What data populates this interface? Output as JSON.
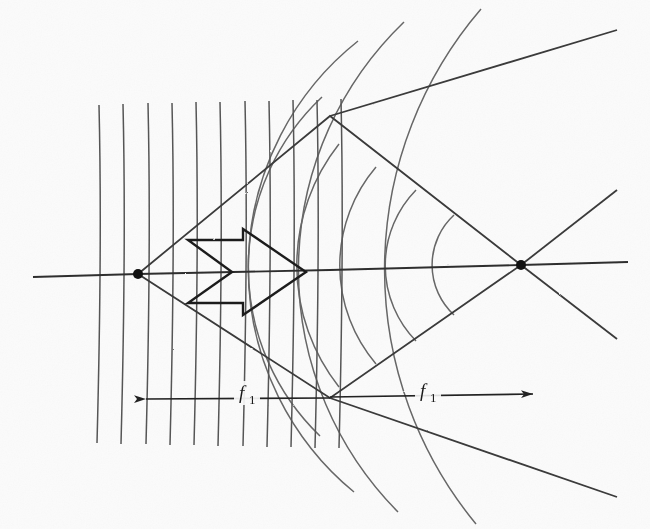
{
  "figure": {
    "kind": "optics-ray-diagram",
    "width": 650,
    "height": 529,
    "background_color": "#fbfbfb",
    "ink_color": "#3d3d3d",
    "bold_ink_color": "#151515"
  },
  "labels": {
    "left_focal": {
      "symbol": "f",
      "subscript": "1",
      "x": 243,
      "y": 398
    },
    "right_focal": {
      "symbol": "f",
      "subscript": "1",
      "x": 424,
      "y": 398
    }
  },
  "optical_axis": {
    "name": "optical-axis",
    "x_start": 33,
    "x_end": 628,
    "y_left": 276,
    "y_right": 264
  },
  "lens_plane": {
    "name": "lens-plane-dashed",
    "x": 330,
    "color": "#151515",
    "segments": [
      {
        "y1": 104,
        "y2": 143,
        "width": 7
      },
      {
        "y1": 160,
        "y2": 208,
        "width": 7
      },
      {
        "y1": 237,
        "y2": 311,
        "width": 8
      },
      {
        "y1": 345,
        "y2": 386,
        "width": 7
      },
      {
        "y1": 412,
        "y2": 452,
        "width": 7
      }
    ]
  },
  "focal_points": [
    {
      "name": "left-focal-point",
      "x": 138,
      "y": 274,
      "r": 5
    },
    {
      "name": "right-focal-point",
      "x": 521,
      "y": 265,
      "r": 5
    }
  ],
  "plane_wavefronts": {
    "name": "plane-wavefronts",
    "count": 11,
    "x_positions": [
      99,
      123,
      148,
      172,
      196,
      220,
      244,
      268,
      292,
      316,
      340
    ],
    "y_top": 105,
    "y_bottom": 443,
    "tilt": 4
  },
  "cone_rays": {
    "name": "converging-cone-rays",
    "upper_ray": {
      "x1": 138,
      "y1": 274,
      "x2": 521,
      "y2": 265,
      "note": "upper envelope via apex top"
    },
    "apex_top": {
      "x": 330,
      "y": 116
    },
    "apex_bottom": {
      "x": 330,
      "y": 398
    },
    "outer_extension_upper_left": {
      "x": 617,
      "y": 30
    },
    "outer_extension_lower_left": {
      "x": 617,
      "y": 497
    }
  },
  "spherical_wavefronts": {
    "name": "spherical-wavefronts",
    "center": {
      "x": 521,
      "y": 265
    },
    "converging_radii": [
      68,
      108,
      152,
      196
    ],
    "diverging_radii": [
      252,
      302
    ],
    "half_angle_deg": 39
  },
  "arrow_symbol": {
    "name": "double-chevron-arrow",
    "tip_x": 306,
    "tip_y": 272,
    "points": "188,240 243,240 243,229 306,272 243,315 243,303 188,303 232,272"
  },
  "dimension_lines": [
    {
      "name": "left-focal-dimension",
      "x1": 143,
      "x2": 330,
      "y": 398,
      "arrow_left": true,
      "arrow_right": false
    },
    {
      "name": "right-focal-dimension",
      "x1": 330,
      "x2": 537,
      "y": 396,
      "arrow_left": false,
      "arrow_right": true
    }
  ]
}
